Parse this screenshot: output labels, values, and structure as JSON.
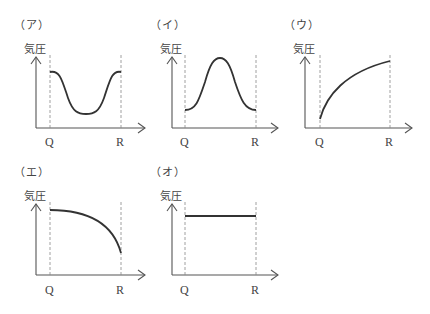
{
  "figure": {
    "panels": [
      {
        "id": "a",
        "label": "（ア）",
        "ylabel": "気圧",
        "q_label": "Q",
        "r_label": "R",
        "shape": "high-low-high (trough between Q and R)"
      },
      {
        "id": "i",
        "label": "（イ）",
        "ylabel": "気圧",
        "q_label": "Q",
        "r_label": "R",
        "shape": "low-high-low (peak between Q and R)"
      },
      {
        "id": "u",
        "label": "（ウ）",
        "ylabel": "気圧",
        "q_label": "Q",
        "r_label": "R",
        "shape": "increasing from Q to R (concave)"
      },
      {
        "id": "e",
        "label": "（エ）",
        "ylabel": "気圧",
        "q_label": "Q",
        "r_label": "R",
        "shape": "decreasing from Q to R (concave)"
      },
      {
        "id": "o",
        "label": "（オ）",
        "ylabel": "気圧",
        "q_label": "Q",
        "r_label": "R",
        "shape": "constant from Q to R"
      }
    ]
  },
  "colors": {
    "curve": "#333333",
    "axis": "#555555",
    "guide": "#888888"
  }
}
